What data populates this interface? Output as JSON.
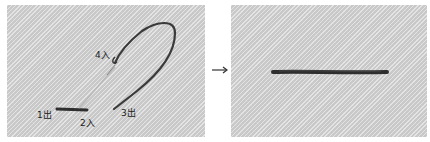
{
  "step_before": {
    "labels": [
      {
        "id": "1",
        "text": "1出",
        "x": 30,
        "y": 106
      },
      {
        "id": "2",
        "text": "2入",
        "x": 73,
        "y": 114
      },
      {
        "id": "3",
        "text": "3出",
        "x": 114,
        "y": 104
      },
      {
        "id": "4",
        "text": "4入",
        "x": 88,
        "y": 46
      }
    ]
  },
  "step_after": {},
  "arrow": {
    "symbol": "→",
    "color": "#333333"
  },
  "colors": {
    "fabric": "#d4d4d4",
    "thread": "#3a3a3a",
    "needle": "#bdbdbd",
    "label": "#222222"
  }
}
